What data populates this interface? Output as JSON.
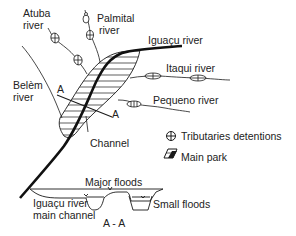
{
  "diagram": {
    "map": {
      "rivers": {
        "atuba": "Atuba\nriver",
        "atuba_line1": "Atuba",
        "atuba_line2": "river",
        "palmital_line1": "Palmital",
        "palmital_line2": "river",
        "iguacu": "Iguaçu river",
        "itaqui": "Itaqui river",
        "belem_line1": "Belèm",
        "belem_line2": "river",
        "pequeno": "Pequeno river"
      },
      "section_marker_top": "A",
      "section_marker_bottom": "A",
      "channel_label": "Channel"
    },
    "legend": {
      "items": [
        {
          "icon": "tributary-detention-icon",
          "label": "Tributaries detentions"
        },
        {
          "icon": "main-park-icon",
          "label": "Main park"
        }
      ]
    },
    "cross_section": {
      "title": "A - A",
      "major_floods": "Major floods",
      "small_floods": "Small floods",
      "main_channel_line1": "Iguaçu river",
      "main_channel_line2": "main channel"
    },
    "colors": {
      "ink": "#1a1a1a",
      "background": "#ffffff"
    }
  }
}
